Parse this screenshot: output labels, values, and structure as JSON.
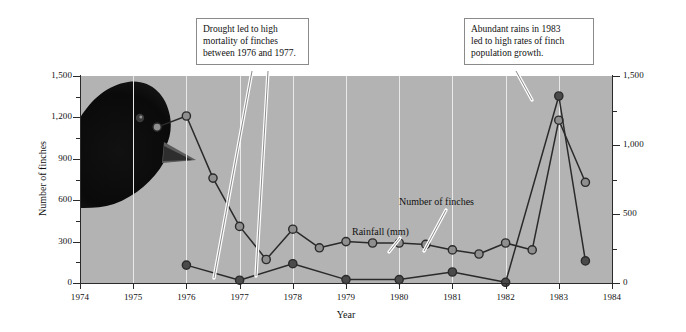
{
  "chart_data": {
    "type": "line",
    "title": "",
    "xlabel": "Year",
    "ylabel": "Number of finches",
    "y2label": "Rainfall, (mm)",
    "xlim": [
      1974,
      1984
    ],
    "ylim": [
      0,
      1500
    ],
    "y2lim": [
      0,
      1500
    ],
    "grid": true,
    "legend_position": "inline-annotations",
    "x_ticks": [
      "1974",
      "1975",
      "1976",
      "1977",
      "1978",
      "1979",
      "1980",
      "1981",
      "1982",
      "1983",
      "1984"
    ],
    "y_ticks_left": [
      "0",
      "300",
      "600",
      "900",
      "1,200",
      "1,500"
    ],
    "y_ticks_right": [
      "0",
      "500",
      "1,000",
      "1,500"
    ],
    "series": [
      {
        "name": "Number of finches",
        "axis": "left",
        "marker": "open-circle",
        "x": [
          1975.45,
          1976.0,
          1976.5,
          1977.0,
          1977.5,
          1978.0,
          1978.5,
          1979.0,
          1979.5,
          1980.0,
          1980.5,
          1981.0,
          1981.5,
          1982.0,
          1982.5,
          1983.0,
          1983.5
        ],
        "values": [
          1130,
          1210,
          760,
          410,
          170,
          390,
          255,
          300,
          290,
          290,
          280,
          240,
          210,
          290,
          240,
          1180,
          730
        ]
      },
      {
        "name": "Rainfall (mm)",
        "axis": "right",
        "marker": "filled-circle",
        "x": [
          1976.0,
          1977.0,
          1978.0,
          1979.0,
          1980.0,
          1981.0,
          1982.0,
          1983.0,
          1983.5
        ],
        "values": [
          130,
          20,
          140,
          25,
          25,
          80,
          5,
          1355,
          160
        ]
      }
    ],
    "annotations": [
      {
        "id": "drought",
        "text": "Drought led to high mortality of finches between 1976 and 1977.",
        "lines": [
          "Drought led to high",
          "mortality of finches",
          "between 1976 and 1977."
        ],
        "points_to": [
          "1976.6",
          "1977.6"
        ]
      },
      {
        "id": "abundant-rains",
        "text": "Abundant rains in 1983 led to high rates of finch population growth.",
        "lines": [
          "Abundant rains in 1983",
          "led to high rates of finch",
          "population growth."
        ],
        "points_to": [
          "1983.0"
        ]
      }
    ],
    "inline_labels": [
      {
        "id": "rainfall-label",
        "text": "Rainfall (mm)"
      },
      {
        "id": "finches-label",
        "text": "Number of finches"
      }
    ],
    "colors": {
      "plot_background": "#b3b3b3",
      "gridline": "#e9e9e9",
      "line": "#2a2a2a",
      "marker_open": "#8f8f8f",
      "marker_filled": "#4a4a4a",
      "callout_background": "#ffffff",
      "callout_border": "#8a8a8a",
      "leader": "#7d7d7d"
    },
    "decoration": {
      "id": "finch-head-photo",
      "description": "Darwin's finch head silhouette"
    }
  }
}
